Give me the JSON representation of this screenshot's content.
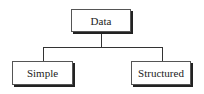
{
  "diagram": {
    "type": "tree",
    "root": {
      "label": "Data"
    },
    "children": [
      {
        "label": "Simple"
      },
      {
        "label": "Structured"
      }
    ]
  },
  "colors": {
    "border": "#555555",
    "shadow": "#222222",
    "connector": "#333333",
    "text": "#222222",
    "background": "#ffffff"
  }
}
